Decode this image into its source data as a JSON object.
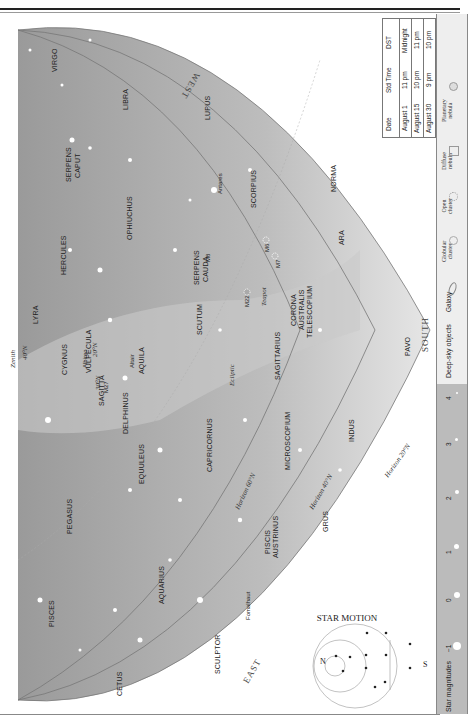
{
  "page": {
    "orientation": "rotated-90"
  },
  "directions": {
    "west": "WEST",
    "east": "EAST",
    "south": "SOUTH",
    "zenith": "Zenith",
    "zenith_lat": "40°N"
  },
  "constellations": [
    {
      "name": "VIRGO"
    },
    {
      "name": "SERPENS CAPUT"
    },
    {
      "name": "LIBRA"
    },
    {
      "name": "LUPUS"
    },
    {
      "name": "OPHIUCHUS"
    },
    {
      "name": "SCORPIUS"
    },
    {
      "name": "NORMA"
    },
    {
      "name": "ARA"
    },
    {
      "name": "HERCULES"
    },
    {
      "name": "SERPENS CAUDA"
    },
    {
      "name": "CORONA AUSTRALIS"
    },
    {
      "name": "TELESCOPIUM"
    },
    {
      "name": "LYRA"
    },
    {
      "name": "CYGNUS"
    },
    {
      "name": "VULPECULA"
    },
    {
      "name": "SAGITTA"
    },
    {
      "name": "AQUILA"
    },
    {
      "name": "SCUTUM"
    },
    {
      "name": "SAGITTARIUS"
    },
    {
      "name": "PAVO"
    },
    {
      "name": "DELPHINUS"
    },
    {
      "name": "EQUULEUS"
    },
    {
      "name": "CAPRICORNUS"
    },
    {
      "name": "MICROSCOPIUM"
    },
    {
      "name": "INDUS"
    },
    {
      "name": "PEGASUS"
    },
    {
      "name": "AQUARIUS"
    },
    {
      "name": "PISCIS AUSTRINUS"
    },
    {
      "name": "GRUS"
    },
    {
      "name": "PISCES"
    },
    {
      "name": "CETUS"
    },
    {
      "name": "SCULPTOR"
    }
  ],
  "stars": [
    "Antares",
    "Albireo",
    "Altair",
    "Fomalhaut"
  ],
  "objects": [
    "M8",
    "M6",
    "M7",
    "M22",
    "M27"
  ],
  "annotations": {
    "ecliptic": "Ecliptic",
    "teapot": "Teapot",
    "horizon60": "Horizon 60°N",
    "horizon40": "Horizon 40°N",
    "horizon20": "Horizon 20°N",
    "lat20": "20°N",
    "lat30": "30°N"
  },
  "star_motion": {
    "title": "STAR MOTION",
    "n": "N",
    "s": "S"
  },
  "time_table": {
    "headers": [
      "Date",
      "Std Time",
      "DST"
    ],
    "rows": [
      [
        "August 1",
        "11 pm",
        "Midnight"
      ],
      [
        "August 15",
        "10 pm",
        "11 pm"
      ],
      [
        "August 30",
        "9 pm",
        "10 pm"
      ]
    ]
  },
  "legend": {
    "magnitudes_label": "Star magnitudes",
    "magnitudes": [
      "−1",
      "0",
      "1",
      "2",
      "3",
      "4",
      "5"
    ],
    "deep_sky_label": "Deep-sky objects",
    "deep_sky": [
      "Galaxy",
      "Globular cluster",
      "Open cluster",
      "Diffuse nebula",
      "Planetary nebula"
    ]
  }
}
